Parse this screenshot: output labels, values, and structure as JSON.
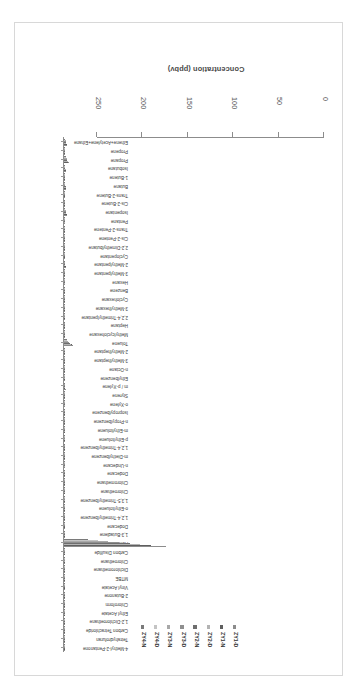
{
  "chart_data": {
    "type": "bar",
    "orientation": "horizontal",
    "title": "",
    "xlabel": "Concentration (ppbv)",
    "ylabel": "",
    "xlim": [
      0,
      250
    ],
    "xticks": [
      0,
      50,
      100,
      150,
      200,
      250
    ],
    "grid": false,
    "legend_position": "top",
    "rotation_deg": 180,
    "categories": [
      "Ethene+Acetylene+Ethane",
      "Propene",
      "Propane",
      "Isobutane",
      "1-Butene",
      "Butane",
      "Trans-2-Butene",
      "Cis-2-Butene",
      "Isopentane",
      "Pentane",
      "Trans-2-Pentene",
      "Cis-2-Pentene",
      "2,2-Dimethylbutane",
      "Cyclopentane",
      "2-Methylpentane",
      "3-Methylpentane",
      "Hexane",
      "Benzene",
      "Cyclohexane",
      "3-Methylhexane",
      "2,2,4-Trimethylpentane",
      "Heptane",
      "Methylcyclohexane",
      "Toluene",
      "2-Methylheptane",
      "3-Methylheptane",
      "n-Octane",
      "Ethylbenzene",
      "m / p-Xylene",
      "Styrene",
      "o-Xylene",
      "Isopropylbenzene",
      "n-Propylbenzene",
      "m-Ethyltoluene",
      "p-Ethyltoluene",
      "1,2,4-Trimethylbenzene",
      "m-Diethylbenzene",
      "n-Undecane",
      "Dodecane",
      "Chloromethane",
      "Chloroethane",
      "1,3,5-Trimethylbenzene",
      "o-Ethyltoluene",
      "1,2,4-Trimethylbenzene",
      "Dodecane",
      "1,3-Butadiene",
      "Acetone",
      "Carbon Disulfide",
      "Chloroethane",
      "Dichloromethane",
      "MTBE",
      "Vinyl Acetate",
      "2-Butanone",
      "Chloroform",
      "Ethyl Acetate",
      "1,2-Dichloroethane",
      "Carbon Tetrachloride",
      "Tetrahydrofuran",
      "4-Methyl-2-Pentanone"
    ],
    "series": [
      {
        "name": "ZY1-D",
        "color": "#8c8c8c",
        "values": [
          3.1,
          0.8,
          5.2,
          2.1,
          0.5,
          2.6,
          0.3,
          0.3,
          3.4,
          1.6,
          0.2,
          0.2,
          0.4,
          0.4,
          1.9,
          1.1,
          1.0,
          1.4,
          0.5,
          0.6,
          0.6,
          0.5,
          0.4,
          9.6,
          0.3,
          0.3,
          0.4,
          0.7,
          1.8,
          0.3,
          0.7,
          0.2,
          0.2,
          0.6,
          0.3,
          0.9,
          0.2,
          0.3,
          0.2,
          1.4,
          0.2,
          0.3,
          0.2,
          0.5,
          0.2,
          0.3,
          112.0,
          0.3,
          0.2,
          1.6,
          1.2,
          0.2,
          0.9,
          0.4,
          0.5,
          0.2,
          0.3,
          0.3,
          0.3
        ]
      },
      {
        "name": "ZY1-N",
        "color": "#5f5f5f",
        "values": [
          2.8,
          0.7,
          4.6,
          1.9,
          0.4,
          2.3,
          0.3,
          0.2,
          3.0,
          1.4,
          0.2,
          0.2,
          0.3,
          0.4,
          1.7,
          1.0,
          0.9,
          1.2,
          0.4,
          0.5,
          0.5,
          0.4,
          0.3,
          8.3,
          0.3,
          0.3,
          0.3,
          0.6,
          1.5,
          0.2,
          0.6,
          0.2,
          0.2,
          0.5,
          0.3,
          0.8,
          0.2,
          0.3,
          0.2,
          1.3,
          0.2,
          0.3,
          0.2,
          0.4,
          0.2,
          0.3,
          96.0,
          0.3,
          0.2,
          1.4,
          1.0,
          0.2,
          0.8,
          0.4,
          0.4,
          0.2,
          0.3,
          0.3,
          0.2
        ]
      },
      {
        "name": "ZY2-D",
        "color": "#b3b3b3",
        "values": [
          2.5,
          0.6,
          4.1,
          1.7,
          0.4,
          2.0,
          0.2,
          0.2,
          2.7,
          1.2,
          0.2,
          0.2,
          0.3,
          0.3,
          1.5,
          0.9,
          0.8,
          1.1,
          0.4,
          0.4,
          0.4,
          0.4,
          0.3,
          7.2,
          0.2,
          0.2,
          0.3,
          0.5,
          1.3,
          0.2,
          0.5,
          0.2,
          0.2,
          0.4,
          0.2,
          0.7,
          0.2,
          0.2,
          0.2,
          1.2,
          0.2,
          0.2,
          0.2,
          0.4,
          0.2,
          0.2,
          84.0,
          0.3,
          0.2,
          1.2,
          0.9,
          0.2,
          0.7,
          0.3,
          0.4,
          0.2,
          0.3,
          0.2,
          0.2
        ]
      },
      {
        "name": "ZY2-N",
        "color": "#6e6e6e",
        "values": [
          2.3,
          0.6,
          3.8,
          1.5,
          0.3,
          1.8,
          0.2,
          0.2,
          2.4,
          1.1,
          0.2,
          0.2,
          0.3,
          0.3,
          1.4,
          0.8,
          0.7,
          1.0,
          0.3,
          0.4,
          0.4,
          0.3,
          0.3,
          6.4,
          0.2,
          0.2,
          0.3,
          0.5,
          1.2,
          0.2,
          0.5,
          0.2,
          0.2,
          0.4,
          0.2,
          0.6,
          0.2,
          0.2,
          0.2,
          1.1,
          0.2,
          0.2,
          0.2,
          0.3,
          0.2,
          0.2,
          73.0,
          0.2,
          0.2,
          1.1,
          0.8,
          0.2,
          0.6,
          0.3,
          0.3,
          0.2,
          0.2,
          0.2,
          0.2
        ]
      },
      {
        "name": "ZY3-D",
        "color": "#8f8f8f",
        "values": [
          2.1,
          0.5,
          3.4,
          1.4,
          0.3,
          1.6,
          0.2,
          0.2,
          2.2,
          1.0,
          0.2,
          0.2,
          0.3,
          0.3,
          1.2,
          0.7,
          0.7,
          0.9,
          0.3,
          0.3,
          0.3,
          0.3,
          0.2,
          5.6,
          0.2,
          0.2,
          0.2,
          0.4,
          1.0,
          0.2,
          0.4,
          0.2,
          0.2,
          0.3,
          0.2,
          0.5,
          0.2,
          0.2,
          0.2,
          1.0,
          0.2,
          0.2,
          0.2,
          0.3,
          0.2,
          0.2,
          61.0,
          0.2,
          0.2,
          1.0,
          0.7,
          0.2,
          0.5,
          0.3,
          0.3,
          0.2,
          0.2,
          0.2,
          0.2
        ]
      },
      {
        "name": "ZY3-N",
        "color": "#a8a8a8",
        "values": [
          1.9,
          0.5,
          3.0,
          1.2,
          0.3,
          1.4,
          0.2,
          0.2,
          1.9,
          0.9,
          0.2,
          0.2,
          0.2,
          0.2,
          1.1,
          0.6,
          0.6,
          0.8,
          0.3,
          0.3,
          0.3,
          0.3,
          0.2,
          4.7,
          0.2,
          0.2,
          0.2,
          0.4,
          0.9,
          0.2,
          0.4,
          0.2,
          0.2,
          0.3,
          0.2,
          0.5,
          0.2,
          0.2,
          0.2,
          0.9,
          0.2,
          0.2,
          0.2,
          0.3,
          0.2,
          0.2,
          49.0,
          0.2,
          0.2,
          0.9,
          0.6,
          0.2,
          0.5,
          0.2,
          0.3,
          0.2,
          0.2,
          0.2,
          0.2
        ]
      },
      {
        "name": "ZY4-D",
        "color": "#c4c4c4",
        "values": [
          1.6,
          0.4,
          2.6,
          1.0,
          0.2,
          1.2,
          0.2,
          0.2,
          1.6,
          0.8,
          0.2,
          0.2,
          0.2,
          0.2,
          0.9,
          0.5,
          0.5,
          0.7,
          0.2,
          0.3,
          0.3,
          0.2,
          0.2,
          3.8,
          0.2,
          0.2,
          0.2,
          0.3,
          0.7,
          0.2,
          0.3,
          0.2,
          0.2,
          0.3,
          0.2,
          0.4,
          0.2,
          0.2,
          0.2,
          0.8,
          0.2,
          0.2,
          0.2,
          0.2,
          0.2,
          0.2,
          37.0,
          0.2,
          0.2,
          0.8,
          0.5,
          0.2,
          0.4,
          0.2,
          0.2,
          0.2,
          0.2,
          0.2,
          0.2
        ]
      },
      {
        "name": "ZY4-N",
        "color": "#7a7a7a",
        "values": [
          1.4,
          0.4,
          2.2,
          0.9,
          0.2,
          1.0,
          0.2,
          0.2,
          1.4,
          0.7,
          0.2,
          0.2,
          0.2,
          0.2,
          0.8,
          0.5,
          0.4,
          0.6,
          0.2,
          0.2,
          0.2,
          0.2,
          0.2,
          2.9,
          0.2,
          0.2,
          0.2,
          0.3,
          0.6,
          0.2,
          0.3,
          0.2,
          0.2,
          0.2,
          0.2,
          0.4,
          0.2,
          0.2,
          0.2,
          0.7,
          0.2,
          0.2,
          0.2,
          0.2,
          0.2,
          0.2,
          26.0,
          0.2,
          0.2,
          0.7,
          0.4,
          0.2,
          0.3,
          0.2,
          0.2,
          0.2,
          0.2,
          0.2,
          0.2
        ]
      }
    ]
  },
  "axis": {
    "title": "Concentration (ppbv)",
    "tick_labels": [
      "0",
      "50",
      "100",
      "150",
      "200",
      "250"
    ]
  },
  "legend": {
    "items": [
      {
        "label": "ZY1-D",
        "color": "#8c8c8c"
      },
      {
        "label": "ZY1-N",
        "color": "#5f5f5f"
      },
      {
        "label": "ZY2-D",
        "color": "#b3b3b3"
      },
      {
        "label": "ZY2-N",
        "color": "#6e6e6e"
      },
      {
        "label": "ZY3-D",
        "color": "#8f8f8f"
      },
      {
        "label": "ZY3-N",
        "color": "#a8a8a8"
      },
      {
        "label": "ZY4-D",
        "color": "#c4c4c4"
      },
      {
        "label": "ZY4-N",
        "color": "#7a7a7a"
      }
    ]
  }
}
